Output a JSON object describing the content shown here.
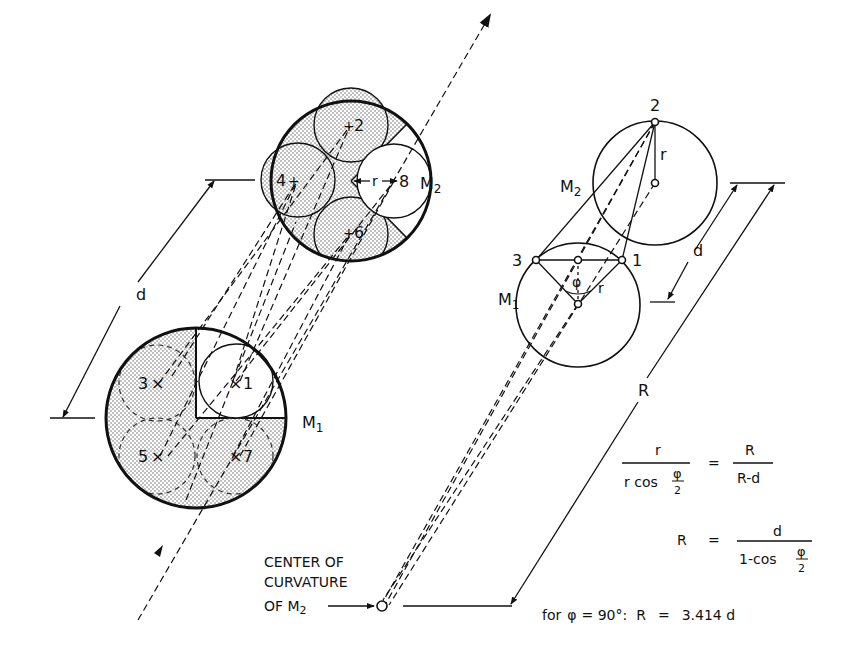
{
  "left_diagram": {
    "labels": {
      "mirror_top": "M",
      "mirror_top_sub": "2",
      "mirror_bottom": "M",
      "mirror_bottom_sub": "1",
      "distance": "d",
      "radius": "r"
    },
    "spots_m2": [
      "2",
      "4",
      "6",
      "8"
    ],
    "spots_m1": [
      "3",
      "1",
      "5",
      "7"
    ],
    "cross_marker": "×"
  },
  "right_diagram": {
    "labels": {
      "point_top": "2",
      "point_left": "3",
      "point_right": "1",
      "mirror_top": "M",
      "mirror_top_sub": "2",
      "mirror_bottom": "M",
      "mirror_bottom_sub": "1",
      "radius_top": "r",
      "radius_bottom": "r",
      "angle": "φ",
      "distance": "d",
      "big_radius": "R"
    },
    "center_label": {
      "line1": "CENTER OF",
      "line2": "CURVATURE",
      "line3": "OF M",
      "line3_sub": "2"
    }
  },
  "equations": {
    "eq1": {
      "lhs_num": "r",
      "lhs_den": "r cos",
      "lhs_den_frac_num": "φ",
      "lhs_den_frac_den": "2",
      "equals": "=",
      "rhs_num": "R",
      "rhs_den": "R-d"
    },
    "eq2": {
      "lhs": "R",
      "equals": "=",
      "rhs_num": "d",
      "rhs_den": "1-cos",
      "rhs_den_frac_num": "φ",
      "rhs_den_frac_den": "2"
    },
    "eq3": {
      "prefix": "for",
      "phi": "φ",
      "condition": "= 90°:",
      "lhs": "R",
      "equals": "=",
      "result": "3.414 d"
    }
  }
}
